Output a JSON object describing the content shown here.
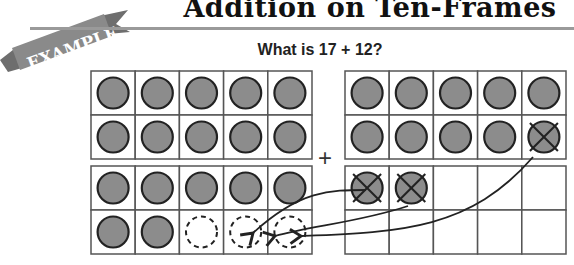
{
  "header": {
    "title": "Addition on Ten-Frames",
    "badge": "EXAMPLE"
  },
  "question": "What is 17 + 12?",
  "operator": "+",
  "colors": {
    "counter_fill": "#8c8c8c",
    "counter_stroke": "#222222",
    "grid": "#555555",
    "ribbon": "#8a8a8a",
    "rule": "#9a9a9a"
  },
  "frames": {
    "left_top": {
      "filled": 10,
      "crossed": 0,
      "dashed": 0
    },
    "left_bottom": {
      "filled": 7,
      "crossed": 0,
      "dashed": 3
    },
    "right_top": {
      "filled": 9,
      "crossed": 1,
      "dashed": 0
    },
    "right_bottom": {
      "filled": 0,
      "crossed": 2,
      "dashed": 0
    }
  },
  "moves": [
    {
      "from": "right_bottom.cell1",
      "to": "left_bottom.cell8"
    },
    {
      "from": "right_bottom.cell2",
      "to": "left_bottom.cell9"
    },
    {
      "from": "right_top.cell10",
      "to": "left_bottom.cell10"
    }
  ]
}
